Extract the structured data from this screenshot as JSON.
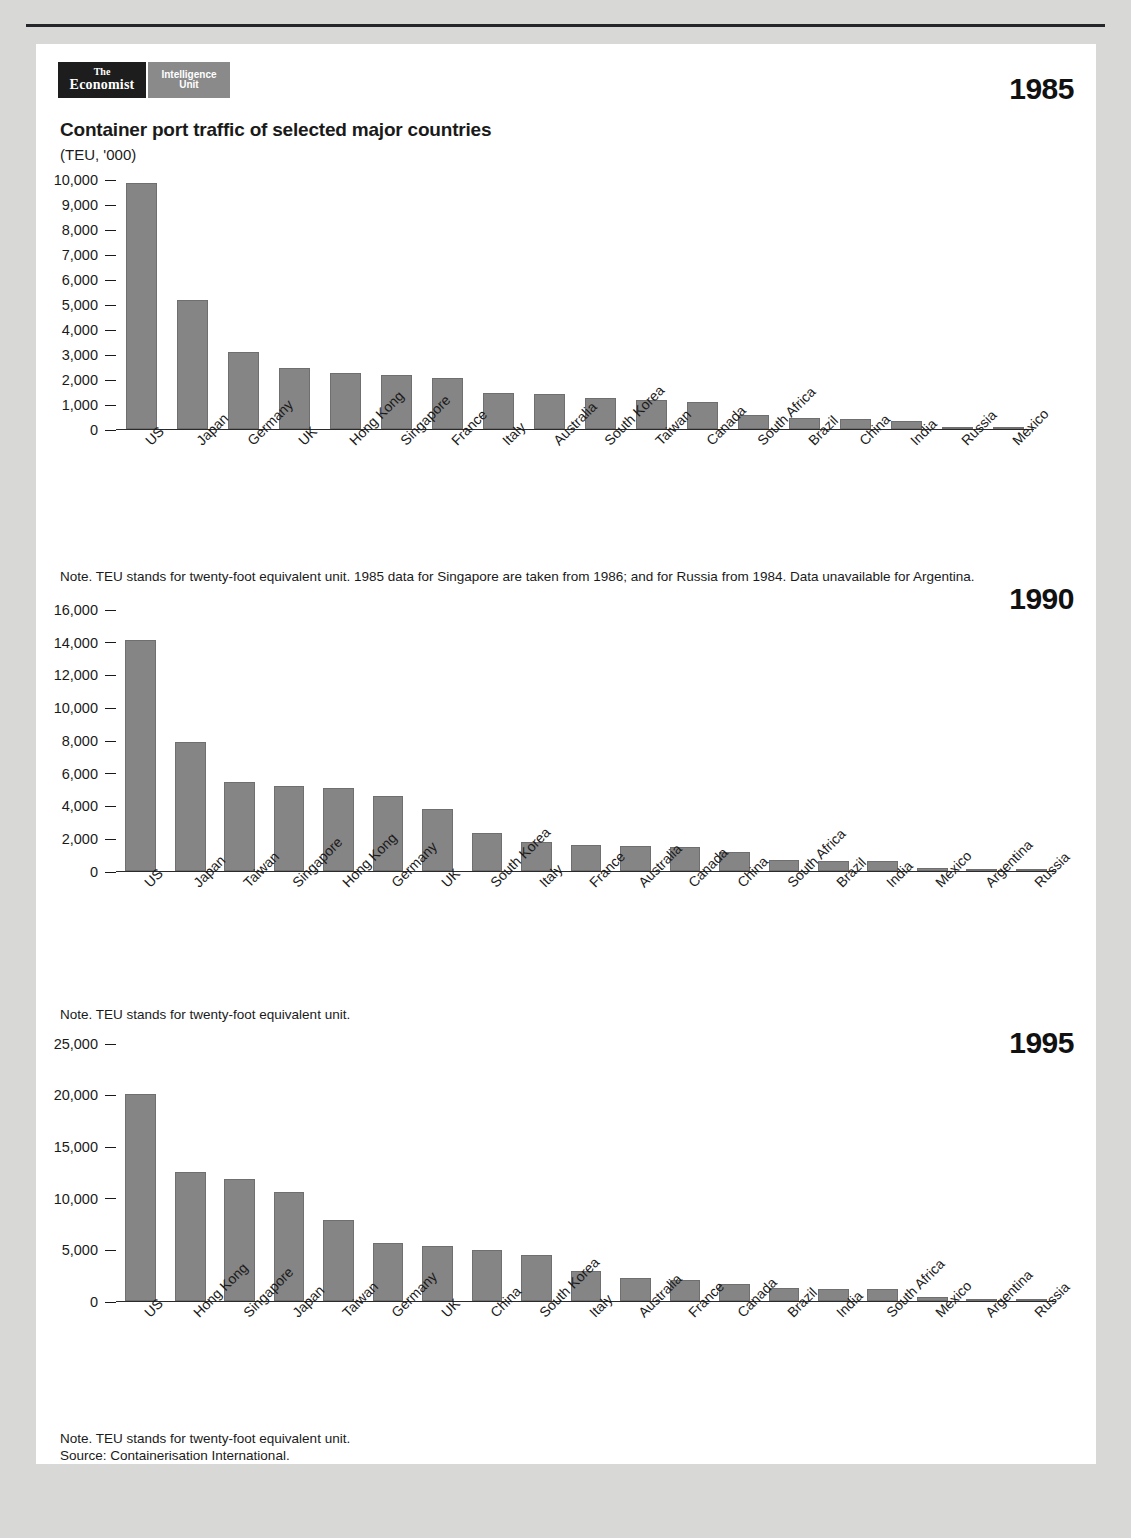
{
  "branding": {
    "economist_line1": "The",
    "economist_line2": "Economist",
    "eiu_line1": "Intelligence",
    "eiu_line2": "Unit"
  },
  "header": {
    "title": "Container port traffic of selected major countries",
    "subtitle": "(TEU, '000)"
  },
  "years": {
    "y1985": "1985",
    "y1990": "1990",
    "y1995": "1995"
  },
  "notes": {
    "note1985": "Note. TEU stands for twenty-foot equivalent unit. 1985 data for Singapore are taken from 1986; and for Russia from 1984. Data unavailable for Argentina.",
    "note1990": "Note. TEU stands for twenty-foot equivalent unit.",
    "note1995_line1": "Note. TEU stands for twenty-foot equivalent unit.",
    "note1995_line2": "Source: Containerisation International."
  },
  "colors": {
    "bar": "#858585",
    "axis": "#2a2a2a",
    "page_bg": "#d8d8d6",
    "sheet_bg": "#ffffff",
    "logo_dark": "#1d1d1d",
    "logo_grey": "#8a8a8a"
  },
  "chart_data": [
    {
      "type": "bar",
      "title": "Container port traffic of selected major countries",
      "subtitle": "(TEU, '000)",
      "year": "1985",
      "xlabel": "",
      "ylabel": "TEU, '000",
      "ylim": [
        0,
        10000
      ],
      "yticks": [
        0,
        1000,
        2000,
        3000,
        4000,
        5000,
        6000,
        7000,
        8000,
        9000,
        10000
      ],
      "ytick_labels": [
        "0",
        "1,000",
        "2,000",
        "3,000",
        "4,000",
        "5,000",
        "6,000",
        "7,000",
        "8,000",
        "9,000",
        "10,000"
      ],
      "grid": false,
      "legend": "none",
      "categories": [
        "US",
        "Japan",
        "Germany",
        "UK",
        "Hong Kong",
        "Singapore",
        "France",
        "Italy",
        "Australia",
        "South Korea",
        "Taiwan",
        "Canada",
        "South Africa",
        "Brazil",
        "China",
        "India",
        "Russia",
        "Mexico"
      ],
      "values": [
        9850,
        5150,
        3080,
        2460,
        2250,
        2170,
        2040,
        1450,
        1390,
        1250,
        1150,
        1070,
        560,
        440,
        390,
        330,
        60,
        40
      ]
    },
    {
      "type": "bar",
      "title": "Container port traffic of selected major countries",
      "subtitle": "(TEU, '000)",
      "year": "1990",
      "xlabel": "",
      "ylabel": "TEU, '000",
      "ylim": [
        0,
        16000
      ],
      "yticks": [
        0,
        2000,
        4000,
        6000,
        8000,
        10000,
        12000,
        14000,
        16000
      ],
      "ytick_labels": [
        "0",
        "2,000",
        "4,000",
        "6,000",
        "8,000",
        "10,000",
        "12,000",
        "14,000",
        "16,000"
      ],
      "grid": false,
      "legend": "none",
      "categories": [
        "US",
        "Japan",
        "Taiwan",
        "Singapore",
        "Hong Kong",
        "Germany",
        "UK",
        "South Korea",
        "Italy",
        "France",
        "Australia",
        "Canada",
        "China",
        "South Africa",
        "Brazil",
        "India",
        "Mexico",
        "Argentina",
        "Russia"
      ],
      "values": [
        14100,
        7850,
        5450,
        5180,
        5050,
        4580,
        3780,
        2320,
        1760,
        1560,
        1520,
        1450,
        1150,
        700,
        640,
        600,
        180,
        150,
        60
      ]
    },
    {
      "type": "bar",
      "title": "Container port traffic of selected major countries",
      "subtitle": "(TEU, '000)",
      "year": "1995",
      "xlabel": "",
      "ylabel": "TEU, '000",
      "ylim": [
        0,
        25000
      ],
      "yticks": [
        0,
        5000,
        10000,
        15000,
        20000,
        25000
      ],
      "ytick_labels": [
        "0",
        "5,000",
        "10,000",
        "15,000",
        "20,000",
        "25,000"
      ],
      "grid": false,
      "legend": "none",
      "categories": [
        "US",
        "Hong Kong",
        "Singapore",
        "Japan",
        "Taiwan",
        "Germany",
        "UK",
        "China",
        "South Korea",
        "Italy",
        "Australia",
        "France",
        "Canada",
        "Brazil",
        "India",
        "South Africa",
        "Mexico",
        "Argentina",
        "Russia"
      ],
      "values": [
        20100,
        12500,
        11850,
        10600,
        7850,
        5600,
        5300,
        4980,
        4480,
        2900,
        2250,
        2080,
        1650,
        1300,
        1150,
        1120,
        400,
        160,
        90
      ]
    }
  ]
}
